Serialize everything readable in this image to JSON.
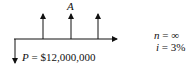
{
  "diagram": {
    "type": "cash-flow-diagram",
    "annuity_label": "A",
    "present_value_label": "P = $12,000,000",
    "present_value_var": "P",
    "present_value_rest": " = $12,000,000",
    "n_var": "n",
    "n_rest": " = ∞",
    "i_var": "i",
    "i_rest": " = 3%",
    "up_arrows": 3,
    "line_color": "#111111"
  }
}
